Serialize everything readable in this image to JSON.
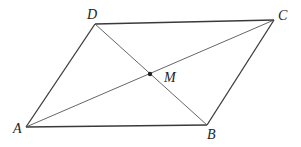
{
  "diagram": {
    "type": "parallelogram-with-diagonals",
    "colors": {
      "side": "#3a3a3a",
      "diagonal": "#555555",
      "point": "#222222",
      "label": "#222222",
      "background": "#ffffff"
    },
    "vertices": {
      "A": {
        "label": "A",
        "x": 26,
        "y": 127
      },
      "B": {
        "label": "B",
        "x": 207,
        "y": 125
      },
      "C": {
        "label": "C",
        "x": 274,
        "y": 20
      },
      "D": {
        "label": "D",
        "x": 95,
        "y": 24
      }
    },
    "midpoint": {
      "label": "M",
      "x": 150,
      "y": 74
    },
    "sides": [
      [
        "A",
        "B"
      ],
      [
        "B",
        "C"
      ],
      [
        "C",
        "D"
      ],
      [
        "D",
        "A"
      ]
    ],
    "diagonals": [
      [
        "A",
        "C"
      ],
      [
        "B",
        "D"
      ]
    ],
    "label_positions": {
      "A": {
        "x": 13,
        "y": 133
      },
      "B": {
        "x": 207,
        "y": 139
      },
      "C": {
        "x": 278,
        "y": 20
      },
      "D": {
        "x": 87,
        "y": 19
      },
      "M": {
        "x": 164,
        "y": 82
      }
    }
  }
}
